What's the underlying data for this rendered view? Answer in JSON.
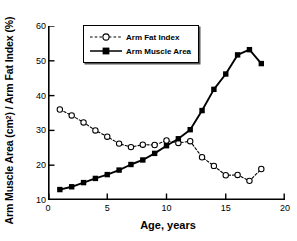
{
  "chart_data": {
    "type": "line",
    "title": "",
    "xlabel": "Age, years",
    "ylabel": "Arm Muscle Area (cm2) / Arm Fat Index (%)",
    "ylabel_prefix": "Arm Muscle Area (cm",
    "ylabel_sup": "2",
    "ylabel_suffix": ") / Arm Fat Index (%)",
    "xlim": [
      0,
      20
    ],
    "ylim": [
      10,
      60
    ],
    "xticks": [
      0,
      5,
      10,
      15,
      20
    ],
    "yticks": [
      10,
      20,
      30,
      40,
      50,
      60
    ],
    "grid": false,
    "legend_position": "top-center",
    "background_color": "#ffffff",
    "axis_color": "#000000",
    "series": [
      {
        "name": "Arm Fat Index",
        "marker": "open-circle",
        "linestyle": "dashed",
        "color": "#000000",
        "x": [
          1,
          2,
          3,
          4,
          5,
          6,
          7,
          8,
          9,
          10,
          11,
          12,
          13,
          14,
          15,
          16,
          17,
          18
        ],
        "values": [
          36.0,
          34.3,
          32.3,
          30.0,
          28.2,
          26.2,
          25.2,
          25.9,
          25.8,
          27.1,
          26.4,
          26.9,
          22.3,
          19.8,
          17.1,
          17.2,
          15.5,
          18.9
        ]
      },
      {
        "name": "Arm Muscle Area",
        "marker": "filled-square",
        "linestyle": "solid",
        "color": "#000000",
        "x": [
          1,
          2,
          3,
          4,
          5,
          6,
          7,
          8,
          9,
          10,
          11,
          12,
          13,
          14,
          15,
          16,
          17,
          18
        ],
        "values": [
          13.0,
          13.8,
          15.0,
          16.2,
          17.3,
          18.6,
          20.2,
          21.5,
          23.4,
          25.6,
          27.6,
          30.2,
          35.7,
          41.8,
          46.2,
          51.7,
          53.2,
          49.2
        ]
      }
    ]
  },
  "legend": {
    "items": [
      {
        "label": "Arm Fat Index"
      },
      {
        "label": "Arm Muscle Area"
      }
    ]
  }
}
